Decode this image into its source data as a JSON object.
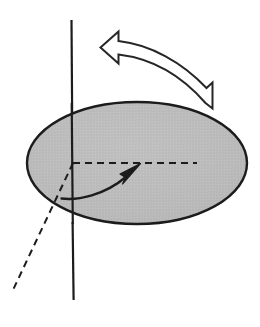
{
  "figure": {
    "title": "Rotating disk about a vertical axis",
    "canvas": {
      "width": 260,
      "height": 327,
      "background": "#ffffff"
    },
    "colors": {
      "stroke": "#1c1c1c",
      "disk_fill": "#b9b9b9",
      "disk_fill_light": "#c6c6c6",
      "background": "#ffffff"
    },
    "elements": {
      "rotation_axis": {
        "label": "rotation axis",
        "kind": "solid-line",
        "x": 72,
        "y_top": 20,
        "y_bottom": 300,
        "stroke_width": 2.2
      },
      "disk": {
        "label": "disk",
        "kind": "filled-ellipse",
        "cx": 137,
        "cy": 163,
        "rx": 110,
        "ry": 61,
        "stroke_width": 2.4
      },
      "rotation_ribbon_arrow": {
        "label": "rotation direction ribbon arrow",
        "kind": "hollow-curved-arrow",
        "direction": "counterclockwise",
        "points_toward": "left",
        "tail_x": 212,
        "tail_y": 104,
        "head_x": 113,
        "head_y": 47,
        "stroke_width": 2.0
      },
      "radius_dashed_line": {
        "label": "radius reference line",
        "kind": "dashed-line",
        "x1": 73,
        "y1": 163,
        "x2": 197,
        "y2": 163,
        "dash": "7 5",
        "stroke_width": 2.0
      },
      "tilted_axis_dashed_line": {
        "label": "tilted axis projection",
        "kind": "dashed-line",
        "x1": 73,
        "y1": 163,
        "x2": 13,
        "y2": 290,
        "dash": "7 5",
        "stroke_width": 2.0
      },
      "angle_sweep_arrow": {
        "label": "angle sweep arrow",
        "kind": "solid-curved-arrow",
        "start_x": 62,
        "start_y": 198,
        "end_x": 139,
        "end_y": 164,
        "stroke_width": 2.4
      }
    }
  },
  "chart_data": {
    "type": "diagram",
    "title": "Rotating disk about a vertical axis",
    "annotations": [
      "vertical rotation axis",
      "gray shaded disk",
      "counterclockwise ribbon arrow",
      "dashed radius reference",
      "dashed tilted axis projection",
      "solid angle sweep arrow"
    ]
  }
}
